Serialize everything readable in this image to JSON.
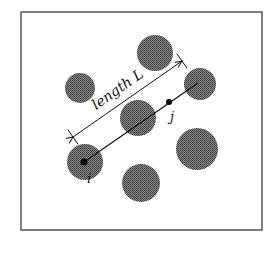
{
  "diagram": {
    "frame": {
      "x": 21,
      "y": 12,
      "width": 241,
      "height": 218,
      "stroke": "#555555"
    },
    "particle_color": "#666666",
    "particles": [
      {
        "cx": 155,
        "cy": 53,
        "r": 18
      },
      {
        "cx": 80,
        "cy": 88,
        "r": 15
      },
      {
        "cx": 200,
        "cy": 84,
        "r": 16
      },
      {
        "cx": 138,
        "cy": 118,
        "r": 18
      },
      {
        "cx": 197,
        "cy": 149,
        "r": 21
      },
      {
        "cx": 85,
        "cy": 162,
        "r": 18
      },
      {
        "cx": 141,
        "cy": 183,
        "r": 19
      }
    ],
    "segment": {
      "x1": 84,
      "y1": 162,
      "x2": 198,
      "y2": 83
    },
    "point_i": {
      "cx": 84,
      "cy": 162,
      "label": "i"
    },
    "point_j": {
      "cx": 169,
      "cy": 102,
      "label": "j"
    },
    "length_arrow": {
      "x1": 73,
      "y1": 137,
      "x2": 182,
      "y2": 61,
      "label": "length L"
    }
  }
}
